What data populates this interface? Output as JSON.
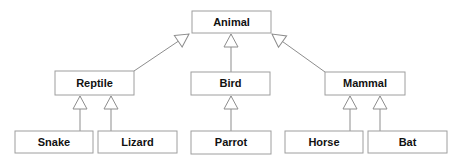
{
  "diagram": {
    "type": "hierarchy-tree",
    "arrow_style": "hollow-triangle-generalization",
    "nodes": [
      {
        "id": "animal",
        "label": "Animal",
        "parent": null
      },
      {
        "id": "reptile",
        "label": "Reptile",
        "parent": "animal"
      },
      {
        "id": "bird",
        "label": "Bird",
        "parent": "animal"
      },
      {
        "id": "mammal",
        "label": "Mammal",
        "parent": "animal"
      },
      {
        "id": "snake",
        "label": "Snake",
        "parent": "reptile"
      },
      {
        "id": "lizard",
        "label": "Lizard",
        "parent": "reptile"
      },
      {
        "id": "parrot",
        "label": "Parrot",
        "parent": "bird"
      },
      {
        "id": "horse",
        "label": "Horse",
        "parent": "mammal"
      },
      {
        "id": "bat",
        "label": "Bat",
        "parent": "mammal"
      }
    ],
    "colors": {
      "background": "#ffffff",
      "box_border": "#9e9e9e",
      "box_fill": "#ffffff",
      "edge_line": "#8d8d8d",
      "label_text": "#111111"
    }
  }
}
